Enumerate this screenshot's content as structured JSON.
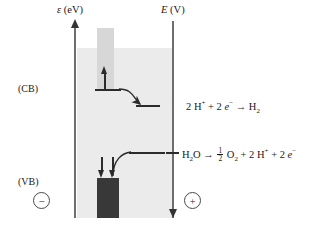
{
  "diagram": {
    "left_axis": {
      "symbol": "ε",
      "unit": "(eV)",
      "name": "energy-axis"
    },
    "right_axis": {
      "symbol": "E",
      "unit": "(V)",
      "name": "potential-axis"
    },
    "band_labels": {
      "conduction_band": "(CB)",
      "valence_band": "(VB)"
    },
    "charge_signs": {
      "negative": "−",
      "positive": "+"
    },
    "reactions": {
      "reduction": {
        "reactants_electrons": "2 H",
        "plus_superscript": "+",
        "mid": " + 2 ",
        "electron_symbol": "e",
        "electron_superscript": "−",
        "arrow": " → H",
        "product_subscript": "2",
        "full_text": "2 H+ + 2 e− → H2"
      },
      "oxidation": {
        "water": "H",
        "water_sub": "2",
        "water_rest": "O",
        "arrow": " → ",
        "frac_num": "1",
        "frac_den": "2",
        "o2": " O",
        "o2_sub": "2",
        "plus1": " + 2 H",
        "sup1": "+",
        "plus2": " + 2 ",
        "e": "e",
        "sup2": "−",
        "full_text": "H2O → ½ O2 + 2 H+ + 2 e−"
      }
    },
    "colors": {
      "field_background": "#ebebeb",
      "excitation_column": "#d7d7d7",
      "valence_block": "#383838",
      "axis": "#6e6e6e",
      "ink": "#1a1a1a",
      "page": "#ffffff"
    }
  }
}
